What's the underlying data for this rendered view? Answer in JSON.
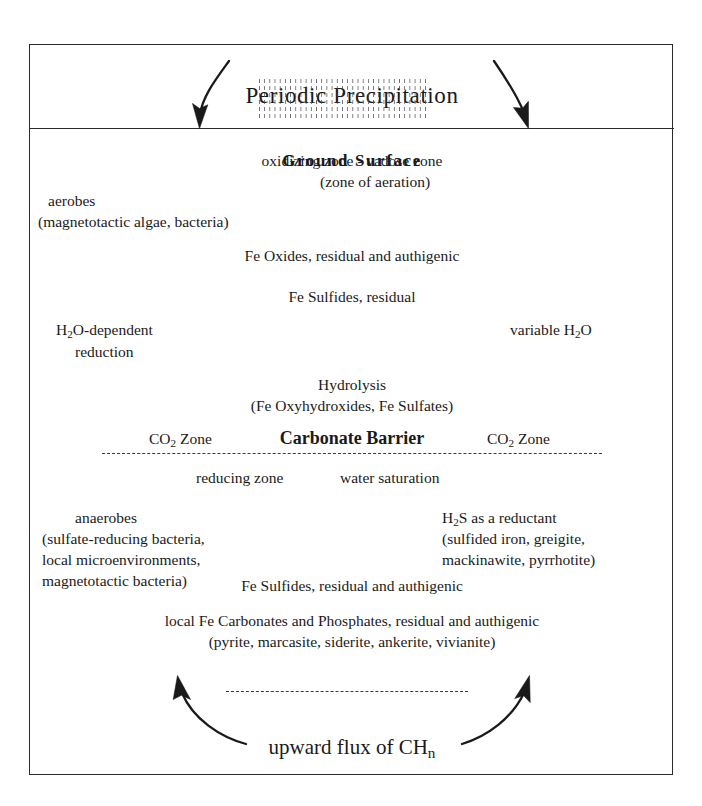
{
  "figure": {
    "title": "Periodic Precipitation",
    "ground_surface_label": "Ground  Surface",
    "bottom_label_prefix": "upward flux of CH",
    "bottom_label_subscript": "n"
  },
  "vadose": {
    "line1": "oxidizing zone - vadose zone",
    "line2": "(zone of aeration)",
    "aerobes_line1": "aerobes",
    "aerobes_line2": "(magnetotactic algae, bacteria)",
    "fe_oxides": "Fe Oxides,  residual and authigenic",
    "fe_sulfides": "Fe Sulfides,  residual"
  },
  "water": {
    "left_line1_prefix": "H",
    "left_line1_sub": "2",
    "left_line1_suffix": "O-dependent",
    "left_line2": "reduction",
    "right_prefix": "variable H",
    "right_sub": "2",
    "right_suffix": "O"
  },
  "hydrolysis": {
    "title": "Hydrolysis",
    "detail": "(Fe Oxyhydroxides, Fe Sulfates)"
  },
  "barrier": {
    "co2_prefix": "CO",
    "co2_sub": "2",
    "co2_suffix": " Zone",
    "center_label": "Carbonate Barrier"
  },
  "reducing": {
    "zone_label": "reducing zone",
    "saturation_label": "water saturation",
    "anaerobes_line1": "anaerobes",
    "anaerobes_line2": "(sulfate-reducing bacteria,",
    "anaerobes_line3": "local microenvironments,",
    "anaerobes_line4": "magnetotactic bacteria)",
    "h2s_prefix": "H",
    "h2s_sub": "2",
    "h2s_suffix": "S as a reductant",
    "h2s_line2": "(sulfided iron, greigite,",
    "h2s_line3": "mackinawite, pyrrhotite)",
    "fe_sulfides": "Fe Sulfides,  residual and authigenic",
    "carbonates_line1": "local Fe Carbonates and Phosphates, residual and authigenic",
    "carbonates_line2": "(pyrite, marcasite, siderite, ankerite, vivianite)"
  },
  "colors": {
    "ink": "#1a1a1a",
    "border": "#2b2b2b",
    "background": "#ffffff"
  }
}
